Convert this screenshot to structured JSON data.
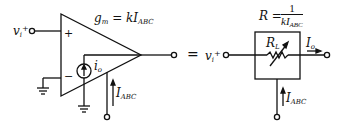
{
  "diagram": {
    "colors": {
      "stroke": "#111111",
      "background": "#ffffff"
    },
    "left": {
      "input_label": "v",
      "input_sub": "i",
      "input_sup": "+",
      "plus_sign": "+",
      "minus_sign": "−",
      "gm_eq": "g",
      "gm_sub": "m",
      "gm_rhs": " = kI",
      "gm_rhs_sub": "ABC",
      "current_source_label": "i",
      "current_source_sub": "o",
      "bias_label": "I",
      "bias_sub": "ABC"
    },
    "equals": "=",
    "right": {
      "input_label": "v",
      "input_sub": "i",
      "input_sup": "+",
      "r_lhs": "R = ",
      "r_num": "1",
      "r_den": "kI",
      "r_den_sub": "ABC",
      "resistor_label": "R",
      "resistor_sub": "L",
      "output_label": "I",
      "output_sub": "o",
      "bias_label": "I",
      "bias_sub": "ABC"
    }
  }
}
